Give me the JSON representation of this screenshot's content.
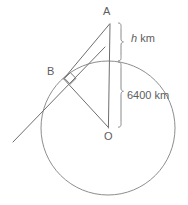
{
  "diagram": {
    "type": "circle-tangent-geometry",
    "points": {
      "apex": {
        "label": "A",
        "x": 110,
        "y": 22
      },
      "tangent": {
        "label": "B",
        "x": 64,
        "y": 78
      },
      "center": {
        "label": "O",
        "x": 108,
        "y": 128
      }
    },
    "circle": {
      "center_x": 108,
      "center_y": 128,
      "radius": 67,
      "stroke_color": "#8d8d8d"
    },
    "measures": [
      {
        "id": "height",
        "value": "h",
        "unit": "km",
        "label": "h km",
        "from_y": 22,
        "to_y": 61,
        "brace_x": 122
      },
      {
        "id": "earth-radius",
        "value": "6400",
        "unit": "km",
        "label": "6400 km",
        "from_y": 61,
        "to_y": 128,
        "brace_x": 122
      }
    ],
    "segments": [
      {
        "id": "segment-AO",
        "from": "A",
        "to": "O"
      },
      {
        "id": "segment-AB",
        "from": "A",
        "to": "B"
      },
      {
        "id": "segment-BO",
        "from": "B",
        "to": "O"
      },
      {
        "id": "tangent-line",
        "through": "B"
      }
    ],
    "right_angle": {
      "at": "B",
      "marker": "square",
      "between": [
        "segment-BO",
        "tangent-line"
      ]
    },
    "colors": {
      "stroke": "#6e6e6e",
      "circle_stroke": "#8d8d8d",
      "brace_stroke": "#8a8a8a",
      "text": "#5d5d5d",
      "background": "#ffffff"
    }
  }
}
